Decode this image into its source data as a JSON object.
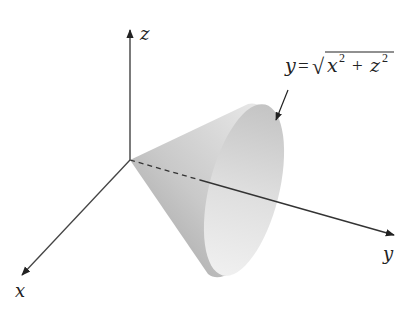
{
  "figure": {
    "type": "3d-surface-diagram",
    "axes": {
      "x": {
        "label": "x"
      },
      "y": {
        "label": "y"
      },
      "z": {
        "label": "z"
      }
    },
    "surface_label": {
      "lhs": "y",
      "equals": "=",
      "radical": "√",
      "term1_base": "x",
      "term1_exp": "2",
      "plus": "+",
      "term2_base": "z",
      "term2_exp": "2"
    },
    "colors": {
      "axis": "#333333",
      "cone_side_dark": "#a8a8a8",
      "cone_side_light": "#e6e6e6",
      "cone_opening": "#d6d6d6",
      "cone_opening_light": "#eeeeee",
      "background": "#ffffff"
    }
  }
}
